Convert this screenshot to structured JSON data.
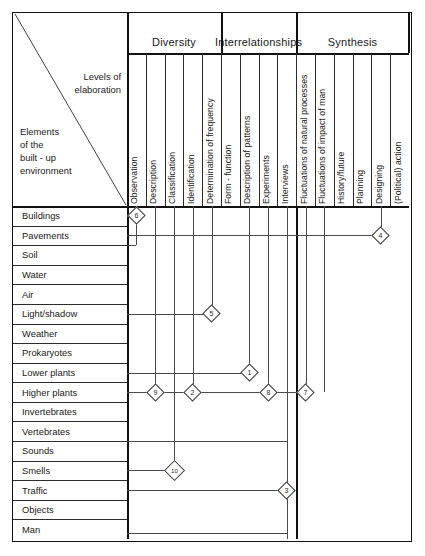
{
  "corner": {
    "levels_label": "Levels of\nelaboration",
    "elements_label": "Elements\nof the\nbuilt - up\nenvironment"
  },
  "groups": [
    {
      "name": "Diversity",
      "label": "Diversity",
      "start_col": 0,
      "end_col": 4
    },
    {
      "name": "Interrelationships",
      "label": "Interrelationships",
      "start_col": 5,
      "end_col": 8
    },
    {
      "name": "Synthesis",
      "label": "Synthesis",
      "start_col": 9,
      "end_col": 14
    }
  ],
  "columns": [
    {
      "id": "observation",
      "label": "Observation"
    },
    {
      "id": "description",
      "label": "Description"
    },
    {
      "id": "classification",
      "label": "Classification"
    },
    {
      "id": "identification",
      "label": "Identification"
    },
    {
      "id": "determination-of-frequency",
      "label": "Determination of frequency"
    },
    {
      "id": "form-function",
      "label": "Form - function"
    },
    {
      "id": "description-of-patterns",
      "label": "Description of patterns"
    },
    {
      "id": "experiments",
      "label": "Experiments"
    },
    {
      "id": "interviews",
      "label": "Interviews"
    },
    {
      "id": "fluctuations-of-natural-processes",
      "label": "Fluctuations of natural processes"
    },
    {
      "id": "fluctuations-of-impact-of-man",
      "label": "Fluctuations of impact of man"
    },
    {
      "id": "history-future",
      "label": "History/future"
    },
    {
      "id": "planning",
      "label": "Planning"
    },
    {
      "id": "designing",
      "label": "Designing"
    },
    {
      "id": "political-action",
      "label": "(Political) action"
    }
  ],
  "rows": [
    {
      "id": "buildings",
      "label": "Buildings"
    },
    {
      "id": "pavements",
      "label": "Pavements"
    },
    {
      "id": "soil",
      "label": "Soil"
    },
    {
      "id": "water",
      "label": "Water"
    },
    {
      "id": "air",
      "label": "Air"
    },
    {
      "id": "light-shadow",
      "label": "Light/shadow"
    },
    {
      "id": "weather",
      "label": "Weather"
    },
    {
      "id": "prokaryotes",
      "label": "Prokaryotes"
    },
    {
      "id": "lower-plants",
      "label": "Lower plants"
    },
    {
      "id": "higher-plants",
      "label": "Higher plants"
    },
    {
      "id": "invertebrates",
      "label": "Invertebrates"
    },
    {
      "id": "vertebrates",
      "label": "Vertebrates"
    },
    {
      "id": "sounds",
      "label": "Sounds"
    },
    {
      "id": "smells",
      "label": "Smells"
    },
    {
      "id": "traffic",
      "label": "Traffic"
    },
    {
      "id": "objects",
      "label": "Objects"
    },
    {
      "id": "man",
      "label": "Man"
    }
  ],
  "markers": [
    {
      "id": "m6",
      "label": "6",
      "row": "buildings",
      "column": "observation"
    },
    {
      "id": "m4",
      "label": "4",
      "row": "pavements",
      "column": "designing"
    },
    {
      "id": "m5",
      "label": "5",
      "row": "light-shadow",
      "column": "determination-of-frequency"
    },
    {
      "id": "m1",
      "label": "1",
      "row": "lower-plants",
      "column": "description-of-patterns"
    },
    {
      "id": "m2",
      "label": "2",
      "row": "higher-plants",
      "column": "identification"
    },
    {
      "id": "m9",
      "label": "9",
      "row": "higher-plants",
      "column": "description"
    },
    {
      "id": "m8",
      "label": "8",
      "row": "higher-plants",
      "column": "experiments"
    },
    {
      "id": "m7",
      "label": "7",
      "row": "higher-plants",
      "column": "fluctuations-of-natural-processes"
    },
    {
      "id": "m10",
      "label": "10",
      "row": "smells",
      "column": "classification"
    },
    {
      "id": "m3",
      "label": "3",
      "row": "traffic",
      "column": "interviews"
    }
  ],
  "chart_data": {
    "type": "table",
    "row_axis_label": "Elements of the built - up environment",
    "column_axis_label": "Levels of elaboration",
    "column_groups": [
      "Diversity",
      "Interrelationships",
      "Synthesis"
    ],
    "columns": [
      "Observation",
      "Description",
      "Classification",
      "Identification",
      "Determination of frequency",
      "Form - function",
      "Description of patterns",
      "Experiments",
      "Interviews",
      "Fluctuations of natural processes",
      "Fluctuations of impact of man",
      "History/future",
      "Planning",
      "Designing",
      "(Political) action"
    ],
    "rows": [
      "Buildings",
      "Pavements",
      "Soil",
      "Water",
      "Air",
      "Light/shadow",
      "Weather",
      "Prokaryotes",
      "Lower plants",
      "Higher plants",
      "Invertebrates",
      "Vertebrates",
      "Sounds",
      "Smells",
      "Traffic",
      "Objects",
      "Man"
    ],
    "cells": [
      {
        "value": 6,
        "row": "Buildings",
        "column": "Observation"
      },
      {
        "value": 4,
        "row": "Pavements",
        "column": "Designing"
      },
      {
        "value": 5,
        "row": "Light/shadow",
        "column": "Determination of frequency"
      },
      {
        "value": 1,
        "row": "Lower plants",
        "column": "Description of patterns"
      },
      {
        "value": 2,
        "row": "Higher plants",
        "column": "Identification"
      },
      {
        "value": 9,
        "row": "Higher plants",
        "column": "Description"
      },
      {
        "value": 8,
        "row": "Higher plants",
        "column": "Experiments"
      },
      {
        "value": 7,
        "row": "Higher plants",
        "column": "Fluctuations of natural processes"
      },
      {
        "value": 10,
        "row": "Smells",
        "column": "Classification"
      },
      {
        "value": 3,
        "row": "Traffic",
        "column": "Interviews"
      }
    ],
    "grid": true,
    "legend": ""
  }
}
